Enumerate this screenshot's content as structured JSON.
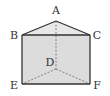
{
  "diagram": {
    "type": "triangular-prism",
    "vertices": {
      "A": {
        "label": "A",
        "x": 56,
        "y": 21,
        "lx": 56,
        "ly": 13
      },
      "B": {
        "label": "B",
        "x": 22,
        "y": 35,
        "lx": 14,
        "ly": 39
      },
      "C": {
        "label": "C",
        "x": 90,
        "y": 35,
        "lx": 97,
        "ly": 39
      },
      "D": {
        "label": "D",
        "x": 56,
        "y": 69,
        "lx": 50,
        "ly": 65
      },
      "E": {
        "label": "E",
        "x": 22,
        "y": 84,
        "lx": 14,
        "ly": 89
      },
      "F": {
        "label": "F",
        "x": 90,
        "y": 84,
        "lx": 97,
        "ly": 89
      }
    },
    "solid_edges": [
      "AB",
      "AC",
      "BC",
      "BE",
      "CF",
      "EF"
    ],
    "hidden_edges": [
      "AD",
      "DE",
      "DF"
    ],
    "colors": {
      "face_fill": "#dcdcdc",
      "top_fill": "#e8e8e8",
      "edge": "#333333",
      "hidden_edge": "#777777"
    }
  }
}
